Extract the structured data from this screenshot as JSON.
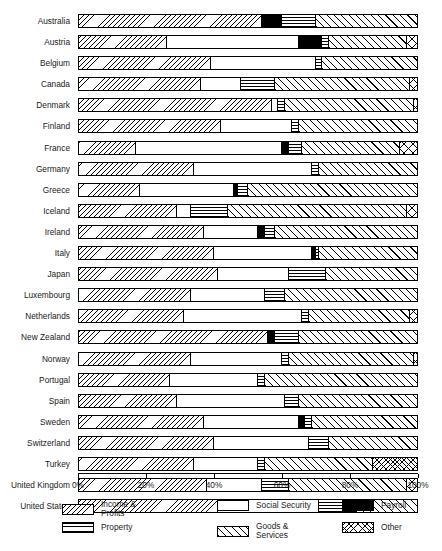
{
  "chart_data": {
    "type": "bar",
    "orientation": "horizontal",
    "stacked": true,
    "normalized": true,
    "title": "",
    "xlabel": "",
    "ylabel": "",
    "xlim": [
      0,
      100
    ],
    "grid": false,
    "legend_position": "bottom",
    "xticks": [
      "0%",
      "20%",
      "40%",
      "60%",
      "80%",
      "100%"
    ],
    "xtick_values": [
      0,
      20,
      40,
      60,
      80,
      100
    ],
    "categories": [
      "Australia",
      "Austria",
      "Belgium",
      "Canada",
      "Denmark",
      "Finland",
      "France",
      "Germany",
      "Greece",
      "Iceland",
      "Ireland",
      "Italy",
      "Japan",
      "Luxembourg",
      "Netherlands",
      "New Zealand",
      "Norway",
      "Portugal",
      "Spain",
      "Sweden",
      "Switzerland",
      "Turkey",
      "United Kingdom",
      "United States"
    ],
    "series": [
      {
        "name": "Income & Profits",
        "key": "income",
        "values": [
          54,
          26,
          39,
          36,
          57,
          42,
          17,
          34,
          18,
          29,
          37,
          40,
          41,
          33,
          31,
          56,
          33,
          27,
          29,
          37,
          40,
          34,
          38,
          41
        ]
      },
      {
        "name": "Social Security",
        "key": "social",
        "values": [
          0,
          39,
          31,
          12,
          2,
          21,
          43,
          35,
          28,
          4,
          16,
          29,
          21,
          22,
          35,
          0,
          27,
          26,
          32,
          28,
          28,
          19,
          16,
          30
        ]
      },
      {
        "name": "Payroll",
        "key": "payroll",
        "values": [
          6,
          7,
          0,
          0,
          0,
          0,
          2,
          0,
          1,
          0,
          2,
          1,
          0,
          0,
          0,
          2,
          0,
          0,
          0,
          2,
          0,
          0,
          0,
          0
        ]
      },
      {
        "name": "Property",
        "key": "property",
        "values": [
          10,
          2,
          2,
          10,
          2,
          2,
          4,
          2,
          3,
          11,
          3,
          1,
          11,
          6,
          2,
          7,
          2,
          2,
          4,
          2,
          6,
          2,
          8,
          11
        ]
      },
      {
        "name": "Goods & Services",
        "key": "goods",
        "values": [
          30,
          23,
          28,
          40,
          38,
          35,
          29,
          29,
          50,
          53,
          42,
          29,
          27,
          39,
          30,
          35,
          37,
          45,
          35,
          31,
          26,
          32,
          35,
          18
        ]
      },
      {
        "name": "Other",
        "key": "other",
        "values": [
          0,
          3,
          0,
          2,
          1,
          0,
          5,
          0,
          0,
          3,
          0,
          0,
          0,
          0,
          2,
          0,
          1,
          0,
          0,
          0,
          0,
          13,
          3,
          0
        ]
      }
    ],
    "legend_entries": [
      {
        "label": "Income &\nProfits",
        "key": "income"
      },
      {
        "label": "Social Security",
        "key": "social"
      },
      {
        "label": "Payroll",
        "key": "payroll"
      },
      {
        "label": "Property",
        "key": "property"
      },
      {
        "label": "Goods &\nServices",
        "key": "goods"
      },
      {
        "label": "Other",
        "key": "other"
      }
    ],
    "colors": {
      "ink": "#000000",
      "background": "#ffffff",
      "payroll_fill": "#000000"
    }
  }
}
